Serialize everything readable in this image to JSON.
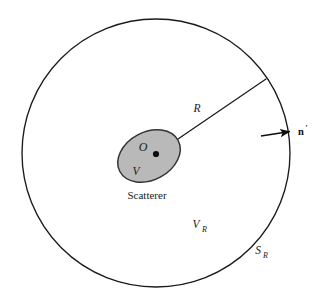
{
  "figure": {
    "kind": "scattering-geometry-diagram",
    "background_color": "#ffffff",
    "line_color": "#1a1a1a",
    "scatterer_fill_color": "#b9b9b9",
    "scatterer_stroke_color": "#333333"
  },
  "outer_boundary": {
    "name_label": "S",
    "name_subscript": "R",
    "center_x": 156,
    "center_y": 153,
    "radius": 134,
    "stroke_width": 1.3,
    "label_x": 258,
    "label_y": 254
  },
  "enclosed_region": {
    "name_label": "V",
    "name_subscript": "R",
    "label_x": 196,
    "label_y": 228
  },
  "scatterer": {
    "caption": "Scatterer",
    "volume_label": "V",
    "caption_x": 147,
    "caption_y": 199,
    "volume_label_x": 136,
    "volume_label_y": 175,
    "center_x": 149,
    "center_y": 156,
    "radius_x": 33,
    "radius_y": 24,
    "rotation_degrees": -28
  },
  "origin": {
    "label": "O",
    "point_x": 156,
    "point_y": 154,
    "dot_radius": 3.1,
    "label_x": 143,
    "label_y": 151
  },
  "radius_line": {
    "label": "R",
    "start_x": 156,
    "start_y": 154,
    "end_x": 266,
    "end_y": 79,
    "label_x": 197,
    "label_y": 112
  },
  "normal_vector": {
    "label": "n",
    "prime": "′",
    "description": "outward unit normal to surface S_R",
    "arrow_start_x": 261,
    "arrow_start_y": 136,
    "arrow_end_x": 292,
    "arrow_end_y": 131,
    "label_x": 299,
    "label_y": 134
  }
}
